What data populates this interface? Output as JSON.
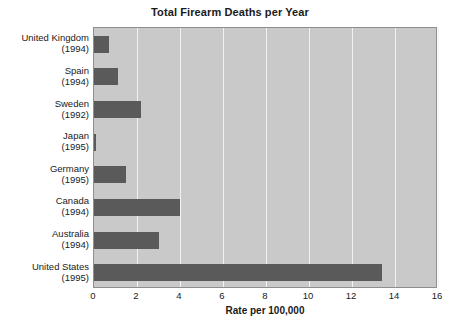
{
  "chart_data": {
    "type": "bar",
    "orientation": "horizontal",
    "title": "Total Firearm Deaths per Year",
    "xlabel": "Rate per 100,000",
    "ylabel": "",
    "xlim": [
      0,
      16
    ],
    "xticks": [
      0,
      2,
      4,
      6,
      8,
      10,
      12,
      14,
      16
    ],
    "xtick_labels": [
      "0",
      "2",
      "4",
      "6",
      "8",
      "10",
      "12",
      "14",
      "16"
    ],
    "grid": "vertical-only",
    "legend": "none",
    "categories": [
      "United Kingdom (1994)",
      "Spain (1994)",
      "Sweden (1992)",
      "Japan (1995)",
      "Germany (1995)",
      "Canada (1994)",
      "Australia (1994)",
      "United States (1995)"
    ],
    "country_labels": [
      {
        "name": "United Kingdom",
        "year": "(1994)"
      },
      {
        "name": "Spain",
        "year": "(1994)"
      },
      {
        "name": "Sweden",
        "year": "(1992)"
      },
      {
        "name": "Japan",
        "year": "(1995)"
      },
      {
        "name": "Germany",
        "year": "(1995)"
      },
      {
        "name": "Canada",
        "year": "(1994)"
      },
      {
        "name": "Australia",
        "year": "(1994)"
      },
      {
        "name": "United States",
        "year": "(1995)"
      }
    ],
    "values": [
      0.7,
      1.1,
      2.2,
      0.07,
      1.5,
      4.0,
      3.0,
      13.4
    ],
    "colors": {
      "bar": "#5a5a5a",
      "plot_background": "#c9c9c9",
      "gridline": "#f2f2f2",
      "plot_border": "#8e8e8e",
      "text": "#1a1a1a",
      "page_background": "#ffffff"
    }
  }
}
